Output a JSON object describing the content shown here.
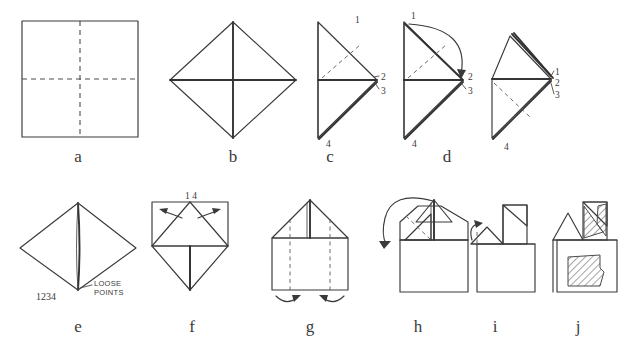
{
  "page": {
    "background_color": "#ffffff",
    "ink_color": "#3a3a3a",
    "width": 640,
    "height": 342
  },
  "steps": [
    {
      "id": "a",
      "label": "a",
      "label_x": 78,
      "label_y": 160,
      "description": "Square sheet with horizontal and vertical dashed crease lines"
    },
    {
      "id": "b",
      "label": "b",
      "label_x": 233,
      "label_y": 160,
      "description": "Square rotated to diamond with solid cross creases"
    },
    {
      "id": "c",
      "label": "c",
      "label_x": 330,
      "label_y": 160,
      "description": "Right half folded, corner points numbered"
    },
    {
      "id": "d",
      "label": "d",
      "label_x": 447,
      "label_y": 160,
      "description": "Curved arrow folds point 1 over to points 2 and 3"
    },
    {
      "id": "e",
      "label": "e",
      "label_x": 78,
      "label_y": 330,
      "description": "Diamond with four loose points at the bottom"
    },
    {
      "id": "f",
      "label": "f",
      "label_x": 192,
      "label_y": 330,
      "description": "Top corners opened outward, points 1 and 4 at apex"
    },
    {
      "id": "g",
      "label": "g",
      "label_x": 310,
      "label_y": 330,
      "description": "House shape with vertical dashed creases and side-fold arrows"
    },
    {
      "id": "h",
      "label": "h",
      "label_x": 418,
      "label_y": 330,
      "description": "Large curved arrow swinging top flap down to the left"
    },
    {
      "id": "i",
      "label": "i",
      "label_x": 495,
      "label_y": 330,
      "description": "Small flap lifted by short curved arrow"
    },
    {
      "id": "j",
      "label": "j",
      "label_x": 578,
      "label_y": 330,
      "description": "Finished model with shaded hatched panels"
    }
  ],
  "point_labels": {
    "c": [
      {
        "text": "1",
        "x": 355,
        "y": 23
      },
      {
        "text": "2",
        "x": 382,
        "y": 78
      },
      {
        "text": "3",
        "x": 382,
        "y": 93
      },
      {
        "text": "4",
        "x": 330,
        "y": 146
      }
    ],
    "d": [
      {
        "text": "1",
        "x": 412,
        "y": 19
      },
      {
        "text": "2",
        "x": 470,
        "y": 79
      },
      {
        "text": "3",
        "x": 470,
        "y": 93
      },
      {
        "text": "4",
        "x": 415,
        "y": 146
      }
    ],
    "e_top": [
      {
        "text": "1",
        "x": 556,
        "y": 74
      },
      {
        "text": "2",
        "x": 556,
        "y": 86
      },
      {
        "text": "3",
        "x": 556,
        "y": 98
      },
      {
        "text": "4",
        "x": 508,
        "y": 150
      }
    ],
    "f": [
      {
        "text": "1 4",
        "x": 190,
        "y": 196
      }
    ]
  },
  "annotations": {
    "loose_points_line1": "LOOSE",
    "loose_points_line2": "POINTS",
    "loose_points_x": 98,
    "loose_points_y": 290,
    "numbers_1234": "1234",
    "numbers_1234_x": 45,
    "numbers_1234_y": 300
  }
}
